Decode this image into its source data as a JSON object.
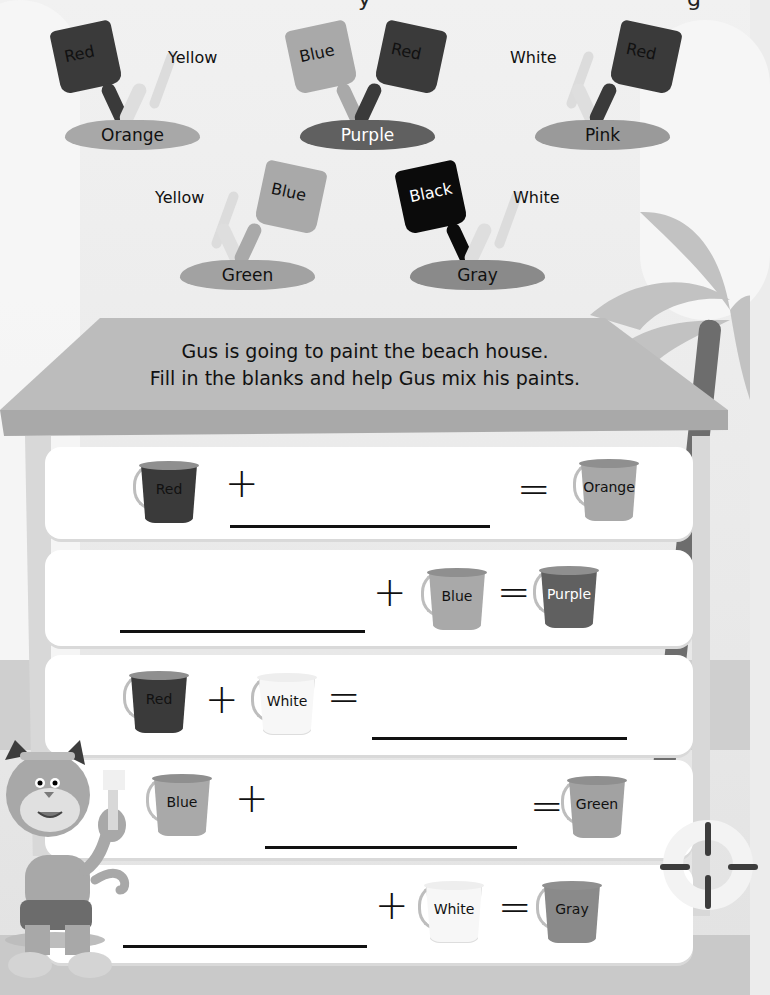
{
  "page": {
    "cut_off_heading_fragment": "y",
    "cut_off_heading_fragment_2": "g"
  },
  "colors": {
    "red": "#3a3a3a",
    "yellow": "#e9e9e9",
    "blue": "#a9a9a9",
    "white": "#f7f7f7",
    "black": "#0b0b0b",
    "orange": "#a8a8a8",
    "purple": "#606060",
    "pink": "#9a9a9a",
    "green": "#a2a2a2",
    "gray": "#8a8a8a",
    "roof": "#b9b9b9"
  },
  "mixes": [
    {
      "left": "Red",
      "right": "Yellow",
      "result": "Orange"
    },
    {
      "left": "Blue",
      "right": "Red",
      "result": "Purple"
    },
    {
      "left": "White",
      "right": "Red",
      "result": "Pink"
    },
    {
      "left": "Yellow",
      "right": "Blue",
      "result": "Green"
    },
    {
      "left": "Black",
      "right": "White",
      "result": "Gray"
    }
  ],
  "instruction": {
    "line1": "Gus is going to paint the beach house.",
    "line2": "Fill in the blanks and help Gus mix his paints."
  },
  "equations": [
    {
      "a": "Red",
      "b": "",
      "result": "Orange",
      "blank": "b"
    },
    {
      "a": "",
      "b": "Blue",
      "result": "Purple",
      "blank": "a"
    },
    {
      "a": "Red",
      "b": "White",
      "result": "",
      "blank": "result"
    },
    {
      "a": "Blue",
      "b": "",
      "result": "Green",
      "blank": "b"
    },
    {
      "a": "",
      "b": "White",
      "result": "Gray",
      "blank": "a"
    }
  ],
  "symbols": {
    "plus": "+",
    "equals": "="
  }
}
